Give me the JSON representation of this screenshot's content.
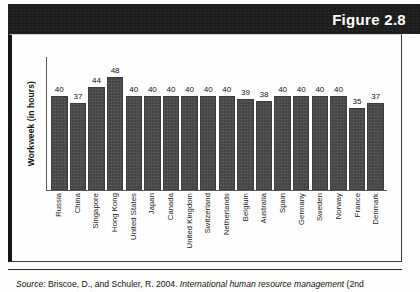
{
  "header": {
    "figure_label": "Figure 2.8"
  },
  "chart_data": {
    "type": "bar",
    "title": "",
    "xlabel": "",
    "ylabel": "Workweek (in hours)",
    "ylim": [
      0,
      52
    ],
    "grid": false,
    "legend": "none",
    "value_labels": true,
    "categories": [
      "Russia",
      "China",
      "Singapore",
      "Hong Kong",
      "United States",
      "Japan",
      "Canada",
      "United Kingdom",
      "Switzerland",
      "Netherlands",
      "Belgium",
      "Australia",
      "Spain",
      "Germany",
      "Sweden",
      "Norway",
      "France",
      "Denmark"
    ],
    "values": [
      40,
      37,
      44,
      48,
      40,
      40,
      40,
      40,
      40,
      40,
      39,
      38,
      40,
      40,
      40,
      40,
      35,
      37
    ]
  },
  "footer": {
    "source_word": "Source:",
    "source_plain_1": " Briscoe, D., and Schuler, R. 2004. ",
    "source_italic": "International human resource management",
    "source_plain_2": " (2nd"
  },
  "colors": {
    "bar_fill": "#4a4a4a",
    "header_band": "#1b1b1b",
    "header_text": "#ffffff",
    "axis": "#5a5a5a",
    "page_background": "#fdfdfc"
  }
}
